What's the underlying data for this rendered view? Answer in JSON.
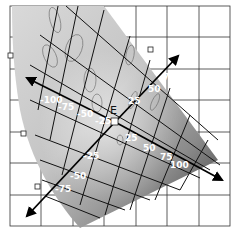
{
  "diagram": {
    "type": "color-space-diagram",
    "grid": {
      "columns": 7,
      "rows": 7,
      "line_color": "#333333",
      "background": "#ffffff"
    },
    "surface": {
      "gradient_light": "#e6e6e6",
      "gradient_dark": "#4a4a4a",
      "mesh_color": "#111111"
    },
    "origin_label": "E",
    "axes": [
      {
        "name": "axis-upper-left",
        "direction": "upper-left",
        "tick_labels": [
          "-100",
          "-75",
          "-50",
          "-25"
        ]
      },
      {
        "name": "axis-lower-right",
        "direction": "lower-right",
        "tick_labels": [
          "25",
          "50",
          "75",
          "100"
        ]
      },
      {
        "name": "axis-lower-left",
        "direction": "lower-left",
        "tick_labels": [
          "-25",
          "-50",
          "-75"
        ]
      },
      {
        "name": "axis-upper-right",
        "direction": "upper-right",
        "tick_labels": [
          "25",
          "50",
          "75"
        ]
      }
    ],
    "labels": {
      "ul_100": "-100",
      "ul_75": "-75",
      "ul_50": "-50",
      "ul_25": "-25",
      "lr_25": "25",
      "lr_50": "50",
      "lr_75": "75",
      "lr_100": "100",
      "ll_25": "-25",
      "ll_50": "-50",
      "ll_75": "-75",
      "ur_25": "25",
      "ur_50": "50",
      "ur_75": "75"
    },
    "markers": {
      "count": 5,
      "shape": "square"
    }
  }
}
